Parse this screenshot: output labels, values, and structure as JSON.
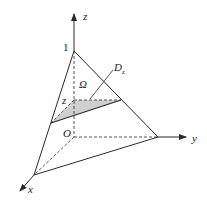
{
  "diagram": {
    "labels": {
      "z_axis": "z",
      "y_axis": "y",
      "x_axis": "x",
      "origin": "O",
      "apex_value": "1",
      "region": "Ω",
      "cross_section": "D",
      "cross_section_sub": "z",
      "height_marker": "z"
    },
    "colors": {
      "stroke": "#2a2a2a",
      "shade": "#cfcfcf",
      "background": "#ffffff"
    },
    "points": {
      "origin": [
        74,
        137
      ],
      "apex": [
        74,
        51
      ],
      "y_end": [
        158,
        137
      ],
      "x_end": [
        34,
        175
      ],
      "slice_left": [
        51,
        123
      ],
      "slice_back": [
        74,
        100
      ],
      "slice_right": [
        121,
        100
      ]
    }
  }
}
